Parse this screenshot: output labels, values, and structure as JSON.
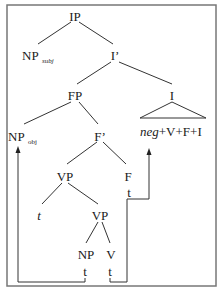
{
  "diagram": {
    "type": "syntax-tree",
    "nodes": {
      "ip": "IP",
      "np_subj": "NP",
      "np_subj_sub": "subj",
      "i_bar": "I’",
      "fp": "FP",
      "i": "I",
      "np_obj": "NP",
      "np_obj_sub": "obj",
      "f_bar": "F’",
      "i_content_neg": "neg",
      "i_content_rest": "+V+F+I",
      "vp_upper": "VP",
      "f": "F",
      "f_trace": "t",
      "vp_spec_trace": "t",
      "vp_lower": "VP",
      "np": "NP",
      "v": "V",
      "np_trace": "t",
      "v_trace": "t"
    },
    "movements": [
      {
        "from": "np_trace",
        "to": "np_obj"
      },
      {
        "from": "v_trace",
        "via": "f_trace",
        "to": "i_content"
      }
    ],
    "colors": {
      "line": "#333333",
      "frame": "#777777",
      "text": "#1a1a1a"
    }
  }
}
